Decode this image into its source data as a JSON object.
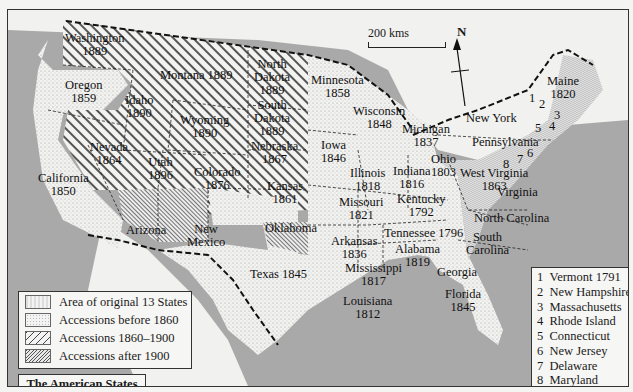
{
  "map": {
    "title": "The American States",
    "scale_label": "200 kms",
    "north_label": "N",
    "colors": {
      "sea": "#a9a9a9",
      "land_foreign": "#f1f1ef",
      "border": "#1a1a1a"
    },
    "legend": [
      {
        "pattern": "original-13",
        "label": "Area of original 13 States"
      },
      {
        "pattern": "dotted",
        "label": "Accessions before 1860"
      },
      {
        "pattern": "wide-hatch",
        "label": "Accessions 1860–1900"
      },
      {
        "pattern": "fine-hatch",
        "label": "Accessions after 1900"
      }
    ],
    "states": [
      {
        "name": "Washington",
        "year": "1889",
        "category": "1860-1900"
      },
      {
        "name": "Oregon",
        "year": "1859",
        "category": "before-1860"
      },
      {
        "name": "California",
        "year": "1850",
        "category": "before-1860"
      },
      {
        "name": "Idaho",
        "year": "1890",
        "category": "1860-1900"
      },
      {
        "name": "Nevada",
        "year": "1864",
        "category": "1860-1900"
      },
      {
        "name": "Montana",
        "year": "1889",
        "category": "1860-1900"
      },
      {
        "name": "Wyoming",
        "year": "1890",
        "category": "1860-1900"
      },
      {
        "name": "Utah",
        "year": "1896",
        "category": "1860-1900"
      },
      {
        "name": "Colorado",
        "year": "1876",
        "category": "1860-1900"
      },
      {
        "name": "North Dakota",
        "year": "1889",
        "category": "1860-1900"
      },
      {
        "name": "South Dakota",
        "year": "1889",
        "category": "1860-1900"
      },
      {
        "name": "Nebraska",
        "year": "1867",
        "category": "1860-1900"
      },
      {
        "name": "Kansas",
        "year": "1861",
        "category": "1860-1900"
      },
      {
        "name": "Arizona",
        "year": "",
        "category": "after-1900"
      },
      {
        "name": "New Mexico",
        "year": "",
        "category": "after-1900"
      },
      {
        "name": "Oklahoma",
        "year": "",
        "category": "after-1900"
      },
      {
        "name": "Texas",
        "year": "1845",
        "category": "before-1860"
      },
      {
        "name": "Minnesota",
        "year": "1858",
        "category": "before-1860"
      },
      {
        "name": "Iowa",
        "year": "1846",
        "category": "before-1860"
      },
      {
        "name": "Missouri",
        "year": "1821",
        "category": "before-1860"
      },
      {
        "name": "Arkansas",
        "year": "1836",
        "category": "before-1860"
      },
      {
        "name": "Louisiana",
        "year": "1812",
        "category": "before-1860"
      },
      {
        "name": "Wisconsin",
        "year": "1848",
        "category": "before-1860"
      },
      {
        "name": "Illinois",
        "year": "1818",
        "category": "before-1860"
      },
      {
        "name": "Michigan",
        "year": "1837",
        "category": "before-1860"
      },
      {
        "name": "Indiana",
        "year": "1816",
        "category": "before-1860"
      },
      {
        "name": "Ohio",
        "year": "1803",
        "category": "before-1860"
      },
      {
        "name": "Kentucky",
        "year": "1792",
        "category": "before-1860"
      },
      {
        "name": "Tennessee",
        "year": "1796",
        "category": "before-1860"
      },
      {
        "name": "Mississippi",
        "year": "1817",
        "category": "before-1860"
      },
      {
        "name": "Alabama",
        "year": "1819",
        "category": "before-1860"
      },
      {
        "name": "Georgia",
        "year": "",
        "category": "original-13"
      },
      {
        "name": "Florida",
        "year": "1845",
        "category": "before-1860"
      },
      {
        "name": "South Carolina",
        "year": "",
        "category": "original-13"
      },
      {
        "name": "North Carolina",
        "year": "",
        "category": "original-13"
      },
      {
        "name": "Virginia",
        "year": "",
        "category": "original-13"
      },
      {
        "name": "West Virginia",
        "year": "1863",
        "category": "1860-1900"
      },
      {
        "name": "Pennsylvania",
        "year": "",
        "category": "original-13"
      },
      {
        "name": "New York",
        "year": "",
        "category": "original-13"
      },
      {
        "name": "Maine",
        "year": "1820",
        "category": "before-1860"
      }
    ],
    "labels": {
      "washington": "Washington",
      "washington_y": "1889",
      "oregon": "Oregon",
      "oregon_y": "1859",
      "california": "California",
      "california_y": "1850",
      "idaho": "Idaho",
      "idaho_y": "1890",
      "nevada": "Nevada",
      "nevada_y": "1864",
      "montana": "Montana 1889",
      "wyoming": "Wyoming",
      "wyoming_y": "1890",
      "utah": "Utah",
      "utah_y": "1896",
      "colorado": "Colorado",
      "colorado_y": "1876",
      "nd1": "North",
      "nd2": "Dakota",
      "nd_y": "1889",
      "sd1": "South",
      "sd2": "Dakota",
      "sd_y": "1889",
      "nebraska": "Nebraska",
      "nebraska_y": "1867",
      "kansas": "Kansas",
      "kansas_y": "1861",
      "arizona": "Arizona",
      "nm1": "New",
      "nm2": "Mexico",
      "oklahoma": "Oklahoma",
      "texas": "Texas 1845",
      "minnesota": "Minnesota",
      "minnesota_y": "1858",
      "iowa": "Iowa",
      "iowa_y": "1846",
      "missouri": "Missouri",
      "missouri_y": "1821",
      "arkansas": "Arkansas",
      "arkansas_y": "1836",
      "louisiana": "Louisiana",
      "louisiana_y": "1812",
      "wisconsin": "Wisconsin",
      "wisconsin_y": "1848",
      "illinois": "Illinois",
      "illinois_y": "1818",
      "michigan": "Michigan",
      "michigan_y": "1837",
      "indiana": "Indiana",
      "indiana_y": "1816",
      "ohio": "Ohio",
      "ohio_y": "1803",
      "kentucky": "Kentucky",
      "kentucky_y": "1792",
      "tennessee": "Tennessee 1796",
      "mississippi": "Mississippi",
      "mississippi_y": "1817",
      "alabama": "Alabama",
      "alabama_y": "1819",
      "georgia": "Georgia",
      "florida": "Florida",
      "florida_y": "1845",
      "sc1": "South",
      "sc2": "Carolina",
      "nc": "North Carolina",
      "virginia": "Virginia",
      "wv": "West Virginia",
      "wv_y": "1863",
      "pennsylvania": "Pennsylvania",
      "newyork": "New York",
      "maine": "Maine",
      "maine_y": "1820",
      "n1": "1",
      "n2": "2",
      "n3": "3",
      "n4": "4",
      "n5": "5",
      "n6": "6",
      "n7": "7",
      "n8": "8"
    },
    "numbered_key": [
      {
        "num": "1",
        "label": "Vermont 1791"
      },
      {
        "num": "2",
        "label": "New Hampshire"
      },
      {
        "num": "3",
        "label": "Massachusetts"
      },
      {
        "num": "4",
        "label": "Rhode Island"
      },
      {
        "num": "5",
        "label": "Connecticut"
      },
      {
        "num": "6",
        "label": "New Jersey"
      },
      {
        "num": "7",
        "label": "Delaware"
      },
      {
        "num": "8",
        "label": "Maryland"
      }
    ]
  }
}
